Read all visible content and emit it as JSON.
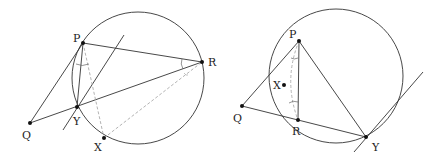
{
  "colors": {
    "line": "#333333",
    "dashed": "#aaaaaa",
    "point": "#111111",
    "background": "#ffffff"
  },
  "figures": [
    {
      "name": "left-figure",
      "circle": {
        "cx": 138,
        "cy": 78,
        "r": 66
      },
      "points": {
        "P": {
          "x": 83,
          "y": 43,
          "label": "P",
          "lx": 73,
          "ly": 42
        },
        "R": {
          "x": 202,
          "y": 62,
          "label": "R",
          "lx": 208,
          "ly": 66
        },
        "Y": {
          "x": 77,
          "y": 107,
          "label": "Y",
          "lx": 73,
          "ly": 125
        },
        "Q": {
          "x": 30,
          "y": 123,
          "label": "Q",
          "lx": 22,
          "ly": 139
        },
        "X": {
          "x": 104,
          "y": 138,
          "label": "X",
          "lx": 94,
          "ly": 151
        }
      },
      "labels": [
        "P",
        "R",
        "Y",
        "Q",
        "X"
      ]
    },
    {
      "name": "right-figure",
      "circle": {
        "cx": 336,
        "cy": 76,
        "r": 67
      },
      "points": {
        "P": {
          "x": 299,
          "y": 41,
          "label": "P",
          "lx": 289,
          "ly": 38
        },
        "X": {
          "x": 284,
          "y": 85,
          "label": "X",
          "lx": 273,
          "ly": 89
        },
        "Q": {
          "x": 242,
          "y": 106,
          "label": "Q",
          "lx": 233,
          "ly": 122
        },
        "R": {
          "x": 298,
          "y": 120,
          "label": "R",
          "lx": 292,
          "ly": 135
        },
        "Y": {
          "x": 366,
          "y": 137,
          "label": "Y",
          "lx": 372,
          "ly": 151
        }
      },
      "labels": [
        "P",
        "X",
        "Q",
        "R",
        "Y"
      ]
    }
  ]
}
